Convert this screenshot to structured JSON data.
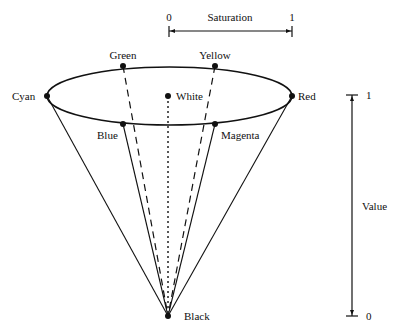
{
  "diagram": {
    "saturation_axis": {
      "label": "Saturation",
      "min_label": "0",
      "max_label": "1"
    },
    "value_axis": {
      "label": "Value",
      "min_label": "0",
      "max_label": "1"
    },
    "points": {
      "cyan": "Cyan",
      "green": "Green",
      "yellow": "Yellow",
      "red": "Red",
      "white": "White",
      "blue": "Blue",
      "magenta": "Magenta",
      "black": "Black"
    },
    "colors": {
      "stroke": "#111111",
      "background": "#ffffff"
    }
  }
}
